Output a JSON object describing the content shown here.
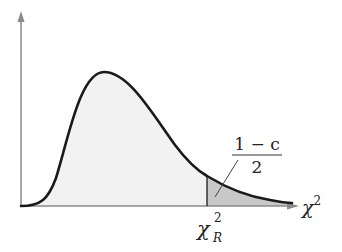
{
  "diagram": {
    "x_axis_label": "χ",
    "x_axis_label_superscript": "2",
    "critical_value_label": "χ",
    "critical_value_superscript": "2",
    "critical_value_subscript": "R",
    "area_label_numerator": "1 − c",
    "area_label_denominator": "2",
    "colors": {
      "curve": "#1a1a1a",
      "axis": "#8a8a8a",
      "body_fill": "#f2f2f2",
      "tail_fill": "#c8c8c8",
      "text": "#222222"
    }
  }
}
